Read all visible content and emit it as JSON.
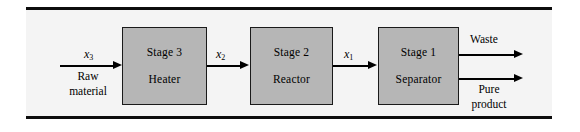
{
  "figure": {
    "type": "process-flow-block-diagram",
    "background_color": "#f4f4f4",
    "box_fill_color": "#b6b6b6",
    "line_color": "#000000",
    "stages": [
      {
        "id": "stage3",
        "title": "Stage 3",
        "subtitle": "Heater"
      },
      {
        "id": "stage2",
        "title": "Stage 2",
        "subtitle": "Reactor"
      },
      {
        "id": "stage1",
        "title": "Stage 1",
        "subtitle": "Separator"
      }
    ],
    "streams": {
      "input": {
        "variable_base": "x",
        "variable_sub": "3",
        "label_line1": "Raw",
        "label_line2": "material"
      },
      "between_3_and_2": {
        "variable_base": "x",
        "variable_sub": "2"
      },
      "between_2_and_1": {
        "variable_base": "x",
        "variable_sub": "1"
      },
      "output_top": {
        "label": "Waste"
      },
      "output_bottom": {
        "label_line1": "Pure",
        "label_line2": "product"
      }
    }
  }
}
